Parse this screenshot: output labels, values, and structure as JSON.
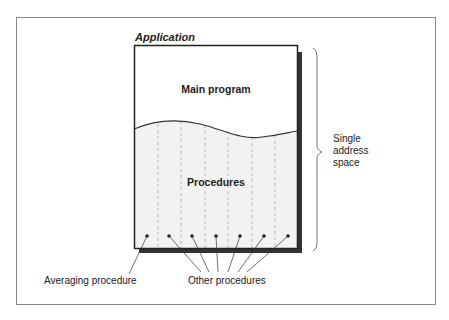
{
  "diagram": {
    "title": "Application",
    "main_program_label": "Main program",
    "procedures_label": "Procedures",
    "address_space_label": [
      "Single",
      "address",
      "space"
    ],
    "averaging_label": "Averaging procedure",
    "other_label": "Other procedures",
    "procedure_count": 7,
    "colors": {
      "frame": "#888888",
      "box_border": "#222222",
      "shadow": "#333333",
      "procedures_fill": "#f2f2f2",
      "dash": "#aaaaaa"
    }
  }
}
